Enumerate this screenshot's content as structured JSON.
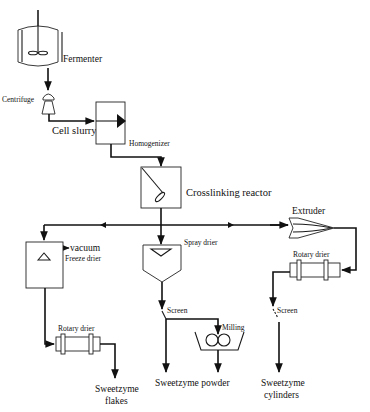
{
  "diagram": {
    "type": "process-flow",
    "units": {
      "fermenter": "Fermenter",
      "centrifuge": "Centrifuge",
      "homogenizer": "Homogenizer",
      "crosslinking_reactor": "Crosslinking reactor",
      "extruder": "Extruder",
      "freeze_drier": "Freeze drier",
      "vacuum": "vacuum",
      "spray_drier": "Spray drier",
      "rotary_drier_left": "Rotary drier",
      "rotary_drier_right": "Rotary drier",
      "screen_middle": "Screen",
      "screen_right": "Screen",
      "milling": "Milling"
    },
    "streams": {
      "cell_slurry": "Cell slurry"
    },
    "products": {
      "flakes_line1": "Sweetzyme",
      "flakes_line2": "flakes",
      "powder": "Sweetzyme powder",
      "cylinders_line1": "Sweetzyme",
      "cylinders_line2": "cylinders"
    },
    "flows": [
      [
        "Fermenter",
        "Centrifuge"
      ],
      [
        "Centrifuge",
        "Homogenizer"
      ],
      [
        "Homogenizer",
        "Crosslinking reactor"
      ],
      [
        "Crosslinking reactor",
        "Freeze drier"
      ],
      [
        "Crosslinking reactor",
        "Spray drier"
      ],
      [
        "Crosslinking reactor",
        "Extruder"
      ],
      [
        "Freeze drier",
        "Rotary drier"
      ],
      [
        "Rotary drier",
        "Sweetzyme flakes"
      ],
      [
        "Spray drier",
        "Screen"
      ],
      [
        "Screen",
        "Milling"
      ],
      [
        "Screen",
        "Sweetzyme powder"
      ],
      [
        "Milling",
        "Sweetzyme powder"
      ],
      [
        "Extruder",
        "Rotary drier"
      ],
      [
        "Rotary drier",
        "Screen"
      ],
      [
        "Screen",
        "Sweetzyme cylinders"
      ]
    ]
  }
}
